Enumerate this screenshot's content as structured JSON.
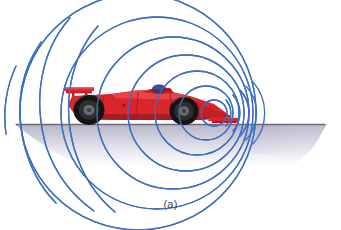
{
  "figure": {
    "caption": "(a)",
    "background_color": "#ffffff"
  },
  "ground": {
    "line_color": "#6b6b73",
    "line_y": 124,
    "line_x_start": 16,
    "line_x_end": 325,
    "shadow_color_top": "#b9b8cc",
    "shadow_color_bottom": "#ffffff"
  },
  "waves": {
    "stroke_color": "#3d6fbe",
    "stroke_width": 1.3,
    "description": "concentric sound wavefronts compressed ahead of the car and spread behind it",
    "emitter_x": 214,
    "emitter_y": 113,
    "fronts": [
      {
        "cx": 214,
        "cy": 113,
        "r": 13
      },
      {
        "cx": 207,
        "cy": 113,
        "r": 26
      },
      {
        "cx": 199,
        "cy": 113,
        "r": 40
      },
      {
        "cx": 190,
        "cy": 113,
        "r": 55
      },
      {
        "cx": 178,
        "cy": 113,
        "r": 72
      },
      {
        "cx": 164,
        "cy": 113,
        "r": 90
      },
      {
        "cx": 148,
        "cy": 113,
        "r": 110
      }
    ],
    "rear_tails": [
      {
        "cx": 120,
        "cy": 113,
        "r": 130
      },
      {
        "cx": 96,
        "cy": 113,
        "r": 150
      },
      {
        "cx": 70,
        "cy": 113,
        "r": 172
      }
    ]
  },
  "car": {
    "name": "formula-one-race-car",
    "body_color": "#d8262c",
    "body_shadow_color": "#a81b22",
    "body_highlight_color": "#ea4a4a",
    "tire_color": "#1a1a1a",
    "tire_inner_color": "#3a3a3a",
    "rim_color": "#5a5a62",
    "wing_color": "#e02a30",
    "rear_wheel": {
      "cx": 89,
      "cy": 110,
      "r": 15
    },
    "front_wheel": {
      "cx": 184,
      "cy": 111,
      "r": 14
    },
    "rear_wing_x": 64,
    "nose_tip_x": 232,
    "helmet_color": "#2b3c78"
  }
}
